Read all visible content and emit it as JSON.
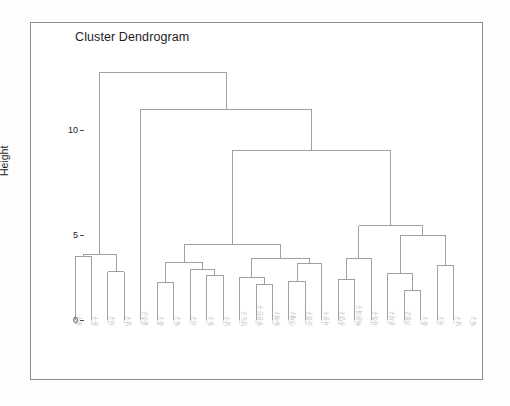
{
  "figure": {
    "title": "Cluster Dendrogram",
    "y_axis_label": "Height",
    "line_color": "#8a8a8a",
    "frame_color": "#8d8d8d",
    "label_color": "#b9b9b9",
    "background": "#ffffff"
  },
  "chart_data": {
    "type": "dendrogram",
    "title": "Cluster Dendrogram",
    "xlabel": "",
    "ylabel": "Height",
    "ylim": [
      0,
      13.6
    ],
    "yticks": [
      0,
      5,
      10
    ],
    "ytick_labels": [
      "0",
      "5",
      "10"
    ],
    "grid": false,
    "legend": null,
    "n_leaves": 25,
    "leaf_labels": [
      "중구",
      "동구",
      "서구",
      "남구",
      "울주군",
      "중구",
      "북구",
      "서구",
      "동구",
      "남구",
      "영도구",
      "부산진구",
      "동래구",
      "연제구",
      "금정구",
      "사상구",
      "수영구",
      "해운대구",
      "사하구",
      "강서구",
      "기장군",
      "중구",
      "서구",
      "남구",
      "북구"
    ],
    "merge_heights": [
      3.35,
      3.25,
      2.55,
      13.05,
      11.1,
      1.95,
      3.05,
      2.65,
      2.35,
      3.95,
      2.25,
      1.85,
      2.95,
      2.75,
      2.05,
      3.45,
      8.9,
      3.25,
      2.15,
      2.45,
      4.95,
      1.55,
      2.85,
      5.25
    ],
    "max_height": 13.05
  },
  "layout": {
    "plot_left_px": 75,
    "plot_right_px": 470,
    "y0_px": 320,
    "y10_px": 130,
    "y5_px": 225
  }
}
